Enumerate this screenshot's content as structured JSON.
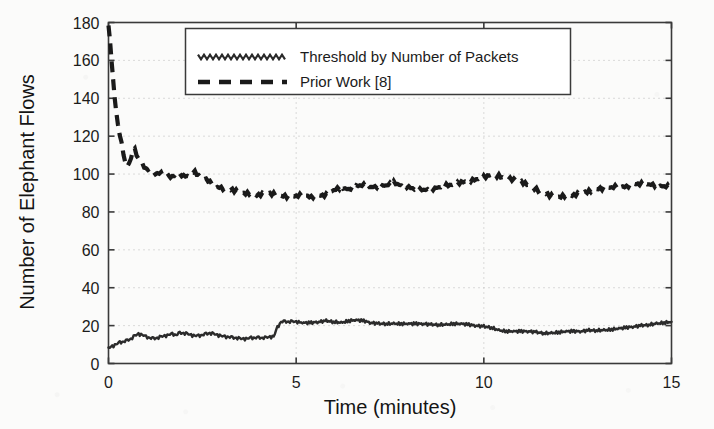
{
  "chart_data": {
    "type": "line",
    "title": "",
    "xlabel": "Time (minutes)",
    "ylabel": "Number of Elephant Flows",
    "xlim": [
      0,
      15
    ],
    "ylim": [
      0,
      180
    ],
    "xticks": [
      0,
      5,
      10,
      15
    ],
    "yticks": [
      0,
      20,
      40,
      60,
      80,
      100,
      120,
      140,
      160,
      180
    ],
    "xtick_labels": [
      "0",
      "5",
      "10",
      "15"
    ],
    "ytick_labels": [
      "0",
      "20",
      "40",
      "60",
      "80",
      "100",
      "120",
      "140",
      "160",
      "180"
    ],
    "grid": true,
    "grid_style": "dotted",
    "legend_position": "top-center",
    "series": [
      {
        "name": "Threshold by Number of Packets",
        "style": "solid-jagged",
        "color": "#2b2b2b",
        "x": [
          0.0,
          0.1,
          0.2,
          0.3,
          0.4,
          0.5,
          0.6,
          0.7,
          0.8,
          0.9,
          1.0,
          1.1,
          1.2,
          1.3,
          1.4,
          1.5,
          1.6,
          1.7,
          1.8,
          1.9,
          2.0,
          2.1,
          2.2,
          2.3,
          2.4,
          2.5,
          2.6,
          2.7,
          2.8,
          2.9,
          3.0,
          3.1,
          3.2,
          3.3,
          3.4,
          3.5,
          3.6,
          3.7,
          3.8,
          3.9,
          4.0,
          4.1,
          4.2,
          4.3,
          4.4,
          4.5,
          4.6,
          4.7,
          4.8,
          4.9,
          5.0,
          5.2,
          5.4,
          5.6,
          5.8,
          6.0,
          6.2,
          6.4,
          6.6,
          6.8,
          7.0,
          7.2,
          7.4,
          7.6,
          7.8,
          8.0,
          8.2,
          8.4,
          8.6,
          8.8,
          9.0,
          9.2,
          9.4,
          9.6,
          9.8,
          10.0,
          10.2,
          10.4,
          10.6,
          10.8,
          11.0,
          11.2,
          11.4,
          11.6,
          11.8,
          12.0,
          12.2,
          12.4,
          12.6,
          12.8,
          13.0,
          13.2,
          13.4,
          13.6,
          13.8,
          14.0,
          14.2,
          14.4,
          14.6,
          14.8,
          15.0
        ],
        "y": [
          8.0,
          9.0,
          10.0,
          11.0,
          11.5,
          12.0,
          13.0,
          14.5,
          15.5,
          15.0,
          14.0,
          13.5,
          13.0,
          13.5,
          14.0,
          14.5,
          15.0,
          15.5,
          15.0,
          16.0,
          16.0,
          15.5,
          15.0,
          14.5,
          14.5,
          15.0,
          15.5,
          16.0,
          15.5,
          15.0,
          14.5,
          14.0,
          14.0,
          13.5,
          13.5,
          13.0,
          13.0,
          13.0,
          13.5,
          13.5,
          13.5,
          13.5,
          13.5,
          14.0,
          14.0,
          19.0,
          22.0,
          22.0,
          22.0,
          22.0,
          22.0,
          21.5,
          21.5,
          22.0,
          22.5,
          22.0,
          21.5,
          22.5,
          23.0,
          22.5,
          21.5,
          21.0,
          21.0,
          21.0,
          21.0,
          21.0,
          21.0,
          21.0,
          20.5,
          20.5,
          20.5,
          21.0,
          21.0,
          20.5,
          20.0,
          19.5,
          19.0,
          17.5,
          17.0,
          17.0,
          17.0,
          17.0,
          16.5,
          16.0,
          16.0,
          16.5,
          17.0,
          17.0,
          17.0,
          17.5,
          17.5,
          17.5,
          18.0,
          18.5,
          19.0,
          19.5,
          20.0,
          20.5,
          21.0,
          21.5,
          22.0
        ]
      },
      {
        "name": "Prior Work [8]",
        "style": "dashed",
        "color": "#1a1a1a",
        "x": [
          0.0,
          0.04,
          0.08,
          0.12,
          0.16,
          0.2,
          0.25,
          0.3,
          0.35,
          0.4,
          0.45,
          0.5,
          0.55,
          0.6,
          0.65,
          0.7,
          0.8,
          0.9,
          1.0,
          1.1,
          1.2,
          1.3,
          1.4,
          1.5,
          1.6,
          1.7,
          1.8,
          1.9,
          2.0,
          2.1,
          2.2,
          2.3,
          2.4,
          2.5,
          2.6,
          2.7,
          2.8,
          2.9,
          3.0,
          3.2,
          3.4,
          3.6,
          3.8,
          4.0,
          4.2,
          4.4,
          4.6,
          4.8,
          5.0,
          5.2,
          5.4,
          5.6,
          5.8,
          6.0,
          6.2,
          6.4,
          6.6,
          6.8,
          7.0,
          7.2,
          7.4,
          7.6,
          7.8,
          8.0,
          8.2,
          8.4,
          8.6,
          8.8,
          9.0,
          9.2,
          9.4,
          9.6,
          9.8,
          10.0,
          10.2,
          10.4,
          10.6,
          10.8,
          11.0,
          11.2,
          11.4,
          11.6,
          11.8,
          12.0,
          12.2,
          12.4,
          12.6,
          12.8,
          13.0,
          13.2,
          13.4,
          13.6,
          13.8,
          14.0,
          14.2,
          14.4,
          14.6,
          14.8,
          15.0
        ],
        "y": [
          178.0,
          170.0,
          160.0,
          150.0,
          141.0,
          133.0,
          126.0,
          120.0,
          116.0,
          110.0,
          105.0,
          104.0,
          105.0,
          108.0,
          112.0,
          113.0,
          108.0,
          105.0,
          103.0,
          102.0,
          101.0,
          100.0,
          100.5,
          99.0,
          98.5,
          99.0,
          99.5,
          100.0,
          99.0,
          98.5,
          100.5,
          101.0,
          99.5,
          98.0,
          97.5,
          96.0,
          94.0,
          93.0,
          92.5,
          92.0,
          91.0,
          90.0,
          89.5,
          89.0,
          90.0,
          89.5,
          88.5,
          88.0,
          88.5,
          89.0,
          88.0,
          88.5,
          89.0,
          91.5,
          93.0,
          92.0,
          93.5,
          94.5,
          93.0,
          93.5,
          94.0,
          95.5,
          94.0,
          93.0,
          92.0,
          91.5,
          92.0,
          93.0,
          94.0,
          94.5,
          95.5,
          96.5,
          97.0,
          98.5,
          99.5,
          99.0,
          97.5,
          97.0,
          96.0,
          94.0,
          92.0,
          90.0,
          88.5,
          88.0,
          88.5,
          89.0,
          90.0,
          91.0,
          92.0,
          92.5,
          93.0,
          93.5,
          93.5,
          94.5,
          95.0,
          94.5,
          94.0,
          93.5,
          93.5
        ]
      }
    ]
  },
  "legend": {
    "entries": [
      {
        "label": "Threshold by Number of Packets",
        "sample": "jagged-line-sample"
      },
      {
        "label": "Prior Work [8]",
        "sample": "dashed-line-sample"
      }
    ]
  },
  "axes": {
    "x_title": "Time (minutes)",
    "y_title": "Number of Elephant Flows",
    "x_tick_labels": [
      "0",
      "5",
      "10",
      "15"
    ],
    "y_tick_labels": [
      "0",
      "20",
      "40",
      "60",
      "80",
      "100",
      "120",
      "140",
      "160",
      "180"
    ]
  },
  "colors": {
    "ink": "#1b1b1b",
    "grid": "#b9b9b9",
    "axis": "#3a3a3a",
    "paper": "#fbfbfa"
  }
}
